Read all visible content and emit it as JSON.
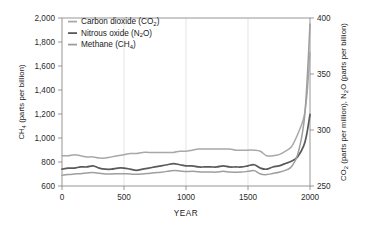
{
  "chart_data": {
    "type": "line",
    "title": "",
    "xlabel": "YEAR",
    "ylabel": "CH4 (parts per billion)",
    "ylabel_right": "CO2 (parts per million), N2O (parts per billion)",
    "xlim": [
      0,
      2000
    ],
    "ylim": [
      600,
      2000
    ],
    "ylim_right": [
      250,
      400
    ],
    "xticks": [
      0,
      500,
      1000,
      1500,
      2000
    ],
    "xtick_labels": [
      "0",
      "500",
      "1000",
      "1500",
      "2000"
    ],
    "yticks": [
      600,
      800,
      1000,
      1200,
      1400,
      1600,
      1800,
      2000
    ],
    "ytick_labels": [
      "600",
      "800",
      "1,000",
      "1,200",
      "1,400",
      "1,600",
      "1,800",
      "2,000"
    ],
    "yticks_right": [
      250,
      300,
      350,
      400
    ],
    "ytick_labels_right": [
      "250",
      "300",
      "350",
      "400"
    ],
    "grid": "vertical-only",
    "legend_position": "top-left-inside",
    "series": [
      {
        "name": "Carbon dioxide (CO2)",
        "legend_label_main": "Carbon dioxide (CO",
        "legend_sub": "2",
        "legend_label_tail": ")",
        "axis": "right",
        "units": "parts per million",
        "color": "#a8a8a8",
        "x": [
          0,
          50,
          100,
          150,
          200,
          250,
          300,
          350,
          400,
          450,
          500,
          550,
          600,
          650,
          700,
          750,
          800,
          850,
          900,
          950,
          1000,
          1050,
          1100,
          1150,
          1200,
          1250,
          1300,
          1350,
          1400,
          1450,
          1500,
          1550,
          1600,
          1650,
          1700,
          1750,
          1800,
          1850,
          1900,
          1950,
          1975,
          2000
        ],
        "y": [
          277,
          277,
          278,
          277,
          276,
          276,
          275,
          275,
          276,
          277,
          278,
          279,
          279,
          280,
          280,
          280,
          280,
          280,
          280,
          281,
          281,
          282,
          283,
          283,
          283,
          283,
          283,
          283,
          282,
          282,
          282,
          282,
          281,
          277,
          277,
          278,
          281,
          285,
          296,
          311,
          331,
          369
        ]
      },
      {
        "name": "Nitrous oxide (N2O)",
        "legend_label_main": "Nitrous oxide (N",
        "legend_sub": "2",
        "legend_label_tail": "O)",
        "axis": "right",
        "units": "parts per billion",
        "color": "#5a5a5a",
        "x": [
          0,
          50,
          100,
          150,
          200,
          250,
          300,
          350,
          400,
          450,
          500,
          550,
          600,
          650,
          700,
          750,
          800,
          850,
          900,
          950,
          1000,
          1050,
          1100,
          1150,
          1200,
          1250,
          1300,
          1350,
          1400,
          1450,
          1500,
          1550,
          1600,
          1650,
          1700,
          1750,
          1800,
          1850,
          1900,
          1950,
          1975,
          2000
        ],
        "y": [
          265,
          266,
          266,
          267,
          267,
          268,
          266,
          265,
          265,
          266,
          266,
          265,
          264,
          265,
          266,
          267,
          268,
          269,
          270,
          269,
          268,
          268,
          267,
          267,
          267,
          267,
          268,
          267,
          267,
          267,
          268,
          269,
          266,
          265,
          267,
          268,
          270,
          272,
          276,
          286,
          297,
          314
        ]
      },
      {
        "name": "Methane (CH4)",
        "legend_label_main": "Methane (CH",
        "legend_sub": "4",
        "legend_label_tail": ")",
        "axis": "left",
        "units": "parts per billion",
        "color": "#9e9e9e",
        "x": [
          0,
          50,
          100,
          150,
          200,
          250,
          300,
          350,
          400,
          450,
          500,
          550,
          600,
          650,
          700,
          750,
          800,
          850,
          900,
          950,
          1000,
          1050,
          1100,
          1150,
          1200,
          1250,
          1300,
          1350,
          1400,
          1450,
          1500,
          1550,
          1600,
          1650,
          1700,
          1750,
          1800,
          1850,
          1900,
          1950,
          1975,
          2000
        ],
        "y": [
          690,
          695,
          700,
          703,
          708,
          712,
          706,
          700,
          700,
          702,
          703,
          700,
          697,
          700,
          705,
          710,
          715,
          722,
          730,
          726,
          720,
          722,
          718,
          716,
          716,
          716,
          723,
          716,
          715,
          716,
          722,
          728,
          700,
          695,
          705,
          715,
          730,
          760,
          860,
          1120,
          1450,
          1950
        ]
      }
    ]
  },
  "legend": {
    "items": [
      {
        "label": "Carbon dioxide (CO2)",
        "color": "#a8a8a8"
      },
      {
        "label": "Nitrous oxide (N2O)",
        "color": "#5a5a5a"
      },
      {
        "label": "Methane (CH4)",
        "color": "#9e9e9e"
      }
    ]
  },
  "axes": {
    "left_title_main": "CH",
    "left_title_sub": "4",
    "left_title_tail": " (parts per billion)",
    "right_title_main": "CO",
    "right_title_sub1": "2",
    "right_title_mid": " (parts per million), N",
    "right_title_sub2": "2",
    "right_title_tail": "O (parts per billion)",
    "x_title": "YEAR"
  }
}
